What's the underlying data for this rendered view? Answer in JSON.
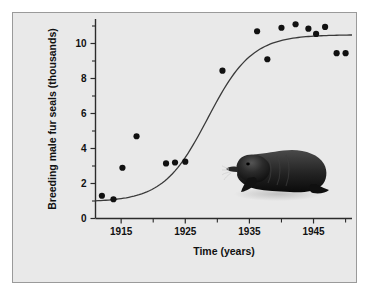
{
  "figure": {
    "background_color": "#e9e9e9",
    "border_color": "#9a9a9a",
    "page_background": "#ffffff"
  },
  "axes": {
    "y_title": "Breeding male fur seals (thousands)",
    "x_title": "Time (years)",
    "y_tick_labels": [
      "0",
      "2",
      "4",
      "6",
      "8",
      "10"
    ],
    "x_tick_labels": [
      "1915",
      "1925",
      "1935",
      "1945"
    ]
  },
  "illustration": {
    "name": "fur-seal-drawing",
    "description": "Northern fur seal silhouette",
    "body_color": "#1a1a1a",
    "highlight_color": "#4a4a4a"
  },
  "chart_data": {
    "type": "scatter",
    "title": "",
    "xlabel": "Time (years)",
    "ylabel": "Breeding male fur seals (thousands)",
    "xlim": [
      1911,
      1951
    ],
    "ylim": [
      0,
      11.4
    ],
    "grid": false,
    "legend": null,
    "x_major_ticks": [
      1915,
      1925,
      1935,
      1945
    ],
    "x_minor_ticks": [
      1920,
      1930,
      1940,
      1950
    ],
    "y_major_ticks": [
      0,
      2,
      4,
      6,
      8,
      10
    ],
    "y_minor_ticks": [
      1,
      3,
      5,
      7,
      9,
      11
    ],
    "points": [
      {
        "x": 1912.0,
        "y": 1.3
      },
      {
        "x": 1913.8,
        "y": 1.1
      },
      {
        "x": 1915.2,
        "y": 2.9
      },
      {
        "x": 1917.4,
        "y": 4.7
      },
      {
        "x": 1922.0,
        "y": 3.15
      },
      {
        "x": 1923.4,
        "y": 3.2
      },
      {
        "x": 1925.0,
        "y": 3.25
      },
      {
        "x": 1930.8,
        "y": 8.45
      },
      {
        "x": 1936.2,
        "y": 10.7
      },
      {
        "x": 1937.8,
        "y": 9.1
      },
      {
        "x": 1940.0,
        "y": 10.9
      },
      {
        "x": 1942.2,
        "y": 11.1
      },
      {
        "x": 1944.2,
        "y": 10.85
      },
      {
        "x": 1945.4,
        "y": 10.55
      },
      {
        "x": 1946.8,
        "y": 10.95
      },
      {
        "x": 1948.6,
        "y": 9.45
      },
      {
        "x": 1950.0,
        "y": 9.45
      }
    ],
    "fit_curve": {
      "model": "logistic",
      "asymptote": 10.5,
      "midpoint_year": 1928.5,
      "growth_rate": 0.29,
      "baseline": 0.95
    }
  }
}
